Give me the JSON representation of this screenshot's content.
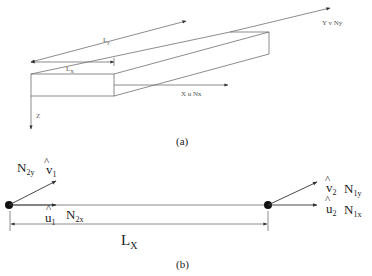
{
  "figure_a": {
    "caption": "(a)",
    "label_ly": "L",
    "label_ly_sub": "y",
    "label_lx": "L",
    "label_lx_sub": "X",
    "axis_z": "Z",
    "axis_x": "X  u  Nx",
    "axis_y": "Y  v  Ny"
  },
  "figure_b": {
    "caption": "(b)",
    "node1_force_y": "N",
    "node1_force_y_sub": "2y",
    "node1_v_hat": "v",
    "node1_v_sub": "1",
    "node1_u_hat": "u",
    "node1_u_sub": "1",
    "node1_force_x": "N",
    "node1_force_x_sub": "2x",
    "length_label": "L",
    "length_label_sub": "X",
    "node2_v_hat": "v",
    "node2_v_sub": "2",
    "node2_force_y": "N",
    "node2_force_y_sub": "1y",
    "node2_u_hat": "u",
    "node2_u_sub": "2",
    "node2_force_x": "N",
    "node2_force_x_sub": "1x",
    "hat": "^"
  }
}
